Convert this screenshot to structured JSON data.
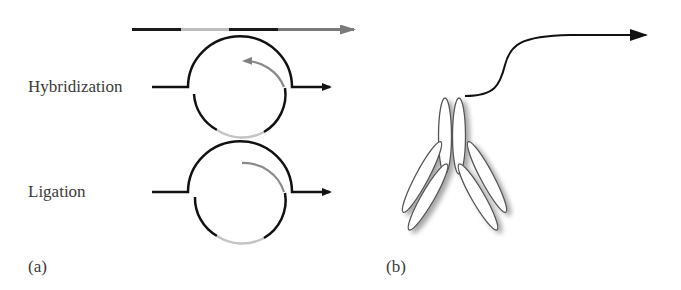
{
  "panel_a": {
    "tag": "(a)",
    "step1_label": "Hybridization",
    "step2_label": "Ligation",
    "colors": {
      "strand_dark": "#1a1a1a",
      "strand_light": "#b8b8b8",
      "arrow_gray": "#7a7a7a"
    }
  },
  "panel_b": {
    "tag": "(b)",
    "colors": {
      "outline": "#555555",
      "fill": "#ffffff",
      "curve": "#111111"
    }
  }
}
